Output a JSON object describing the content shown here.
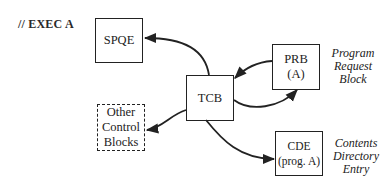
{
  "diagram": {
    "title": "// EXEC A",
    "nodes": {
      "spqe": {
        "lines": [
          "SPQE"
        ],
        "style": "solid"
      },
      "tcb": {
        "lines": [
          "TCB"
        ],
        "style": "solid"
      },
      "prb": {
        "lines": [
          "PRB",
          "(A)"
        ],
        "style": "solid"
      },
      "ocb": {
        "lines": [
          "Other",
          "Control",
          "Blocks"
        ],
        "style": "dashed"
      },
      "cde": {
        "lines": [
          "CDE",
          "(prog. A)"
        ],
        "style": "solid"
      }
    },
    "captions": {
      "prb": [
        "Program",
        "Request",
        "Block"
      ],
      "cde": [
        "Contents",
        "Directory",
        "Entry"
      ]
    },
    "edges": [
      {
        "from": "TCB",
        "to": "SPQE"
      },
      {
        "from": "PRB",
        "to": "TCB"
      },
      {
        "from": "TCB",
        "to": "PRB"
      },
      {
        "from": "TCB",
        "to": "Other Control Blocks"
      },
      {
        "from": "TCB",
        "to": "CDE"
      }
    ]
  }
}
